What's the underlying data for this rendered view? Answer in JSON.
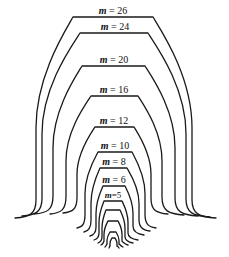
{
  "diagram": {
    "type": "nested-contour-curves",
    "stroke_color": "#1a1a1a",
    "background": "#ffffff",
    "curves": [
      {
        "m": "26",
        "label": "m = 26",
        "top_y": 17,
        "top_x1": 73,
        "top_x2": 153,
        "side_left_x": 36,
        "side_right_x": 192,
        "end_left": [
          15,
          218
        ],
        "end_right": [
          216,
          218
        ],
        "label_y": 6
      },
      {
        "m": "24",
        "label": "m = 24",
        "top_y": 33,
        "top_x1": 80,
        "top_x2": 148,
        "side_left_x": 42,
        "side_right_x": 186,
        "end_left": [
          22,
          216
        ],
        "end_right": [
          210,
          217
        ],
        "label_y": 22
      },
      {
        "m": "20",
        "label": "m = 20",
        "top_y": 66,
        "top_x1": 82,
        "top_x2": 145,
        "side_left_x": 53,
        "side_right_x": 175,
        "end_left": [
          34,
          214
        ],
        "end_right": [
          198,
          216
        ],
        "label_y": 55
      },
      {
        "m": "16",
        "label": "m = 16",
        "top_y": 96,
        "top_x1": 91,
        "top_x2": 138,
        "side_left_x": 66,
        "side_right_x": 162,
        "end_left": [
          50,
          214
        ],
        "end_right": [
          184,
          215
        ],
        "label_y": 85
      },
      {
        "m": "12",
        "label": "m = 12",
        "top_y": 127,
        "top_x1": 95,
        "top_x2": 134,
        "side_left_x": 77,
        "side_right_x": 151,
        "end_left": [
          63,
          213
        ],
        "end_right": [
          168,
          214
        ],
        "label_y": 116
      },
      {
        "m": "10",
        "label": "m = 10",
        "top_y": 152,
        "top_x1": 98,
        "top_x2": 132,
        "side_left_x": 85,
        "side_right_x": 145,
        "end_left": [
          77,
          228
        ],
        "end_right": [
          156,
          228
        ],
        "label_y": 141
      },
      {
        "m": "8",
        "label": "m = 8",
        "top_y": 168,
        "top_x1": 100,
        "top_x2": 127,
        "side_left_x": 91,
        "side_right_x": 139,
        "end_left": [
          84,
          232
        ],
        "end_right": [
          150,
          231
        ],
        "label_y": 157
      },
      {
        "m": "6",
        "label": "m = 6",
        "top_y": 186,
        "top_x1": 103,
        "top_x2": 125,
        "side_left_x": 96,
        "side_right_x": 133,
        "end_left": [
          90,
          236
        ],
        "end_right": [
          144,
          235
        ],
        "label_y": 175
      },
      {
        "m": "5",
        "label": "m=5",
        "top_y": 201,
        "top_x1": 104,
        "top_x2": 122,
        "side_left_x": 99,
        "side_right_x": 128,
        "end_left": [
          94,
          240
        ],
        "end_right": [
          138,
          240
        ],
        "label_y": 190
      },
      {
        "m": "",
        "label": "",
        "top_y": 210,
        "top_x1": 106,
        "top_x2": 120,
        "side_left_x": 102,
        "side_right_x": 125,
        "end_left": [
          98,
          243
        ],
        "end_right": [
          133,
          243
        ]
      },
      {
        "m": "",
        "label": "",
        "top_y": 221,
        "top_x1": 108,
        "top_x2": 118,
        "side_left_x": 104,
        "side_right_x": 122,
        "end_left": [
          101,
          245
        ],
        "end_right": [
          128,
          245
        ]
      },
      {
        "m": "",
        "label": "",
        "top_y": 232,
        "top_x1": 110,
        "top_x2": 116,
        "side_left_x": 107,
        "side_right_x": 119,
        "end_left": [
          105,
          247
        ],
        "end_right": [
          123,
          247
        ]
      },
      {
        "m": "",
        "label": "",
        "top_y": 238,
        "top_x1": 112,
        "top_x2": 115,
        "side_left_x": 110,
        "side_right_x": 117,
        "end_left": [
          109,
          248
        ],
        "end_right": [
          119,
          248
        ]
      }
    ]
  },
  "labels": {
    "m26": {
      "var": "m",
      "text": " = 26"
    },
    "m24": {
      "var": "m",
      "text": " = 24"
    },
    "m20": {
      "var": "m",
      "text": " = 20"
    },
    "m16": {
      "var": "m",
      "text": " = 16"
    },
    "m12": {
      "var": "m",
      "text": " = 12"
    },
    "m10": {
      "var": "m",
      "text": " = 10"
    },
    "m8": {
      "var": "m",
      "text": " = 8"
    },
    "m6": {
      "var": "m",
      "text": " = 6"
    },
    "m5": {
      "var": "m",
      "text": "=5"
    }
  }
}
